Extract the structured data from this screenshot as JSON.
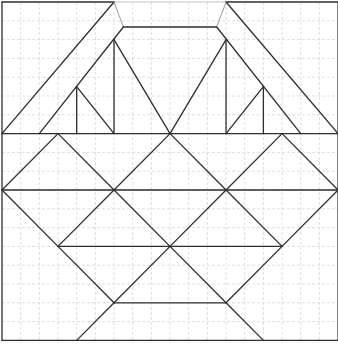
{
  "diagram": {
    "type": "tangram-style geometric figure on dashed grid",
    "grid": {
      "cols": 18,
      "rows": 18,
      "origin_px": [
        2,
        2
      ],
      "cell_px": [
        18.67,
        18.8
      ],
      "color": "#d6d6d6",
      "dashed": true
    },
    "colors": {
      "edge": "#2e2e2e",
      "light_edge": "#9a9a9a",
      "faint_edge": "#c4c4c4"
    },
    "segments": [
      {
        "name": "border-left",
        "from": [
          0,
          0
        ],
        "to": [
          0,
          18
        ],
        "style": "edge"
      },
      {
        "name": "border-right",
        "from": [
          18,
          0
        ],
        "to": [
          18,
          18
        ],
        "style": "edge"
      },
      {
        "name": "border-bottom",
        "from": [
          0,
          18
        ],
        "to": [
          18,
          18
        ],
        "style": "edge"
      },
      {
        "name": "border-top-left",
        "from": [
          0,
          0
        ],
        "to": [
          6,
          0
        ],
        "style": "edge"
      },
      {
        "name": "border-top-middle",
        "from": [
          6,
          0
        ],
        "to": [
          12,
          0
        ],
        "style": "faint"
      },
      {
        "name": "border-top-right",
        "from": [
          12,
          0
        ],
        "to": [
          18,
          0
        ],
        "style": "edge"
      },
      {
        "name": "left-outer-diagonal",
        "from": [
          6,
          0
        ],
        "to": [
          0,
          7
        ],
        "style": "edge"
      },
      {
        "name": "left-connector",
        "from": [
          6,
          0
        ],
        "to": [
          6.5,
          1.33
        ],
        "style": "light"
      },
      {
        "name": "top-inner-horizontal",
        "from": [
          6.5,
          1.33
        ],
        "to": [
          11.5,
          1.33
        ],
        "style": "edge"
      },
      {
        "name": "left-inner-diagonal",
        "from": [
          6.5,
          1.33
        ],
        "to": [
          2,
          7
        ],
        "style": "edge"
      },
      {
        "name": "left-triangle-vertical",
        "from": [
          6,
          2
        ],
        "to": [
          6,
          7
        ],
        "style": "edge"
      },
      {
        "name": "left-triangle-right-side",
        "from": [
          6,
          2
        ],
        "to": [
          9,
          7
        ],
        "style": "edge"
      },
      {
        "name": "left-small-triangle-vertical",
        "from": [
          4,
          4.5
        ],
        "to": [
          4,
          7
        ],
        "style": "edge"
      },
      {
        "name": "left-small-triangle-right-side",
        "from": [
          4,
          4.5
        ],
        "to": [
          6,
          7
        ],
        "style": "edge"
      },
      {
        "name": "right-outer-diagonal",
        "from": [
          12,
          0
        ],
        "to": [
          18,
          7
        ],
        "style": "edge"
      },
      {
        "name": "right-connector",
        "from": [
          12,
          0
        ],
        "to": [
          11.5,
          1.33
        ],
        "style": "light"
      },
      {
        "name": "right-inner-diagonal",
        "from": [
          11.5,
          1.33
        ],
        "to": [
          16,
          7
        ],
        "style": "edge"
      },
      {
        "name": "right-triangle-vertical",
        "from": [
          12,
          2
        ],
        "to": [
          12,
          7
        ],
        "style": "edge"
      },
      {
        "name": "right-triangle-left-side",
        "from": [
          12,
          2
        ],
        "to": [
          9,
          7
        ],
        "style": "edge"
      },
      {
        "name": "right-small-triangle-vertical",
        "from": [
          14,
          4.5
        ],
        "to": [
          14,
          7
        ],
        "style": "edge"
      },
      {
        "name": "right-small-triangle-left-side",
        "from": [
          14,
          4.5
        ],
        "to": [
          12,
          7
        ],
        "style": "edge"
      },
      {
        "name": "horizontal-row-7",
        "from": [
          0,
          7
        ],
        "to": [
          18,
          7
        ],
        "style": "edge"
      },
      {
        "name": "diag-3-7-to-0-10",
        "from": [
          3,
          7
        ],
        "to": [
          0,
          10
        ],
        "style": "edge"
      },
      {
        "name": "diag-3-7-to-6-10",
        "from": [
          3,
          7
        ],
        "to": [
          6,
          10
        ],
        "style": "edge"
      },
      {
        "name": "diag-9-7-to-6-10",
        "from": [
          9,
          7
        ],
        "to": [
          6,
          10
        ],
        "style": "edge"
      },
      {
        "name": "diag-9-7-to-12-10",
        "from": [
          9,
          7
        ],
        "to": [
          12,
          10
        ],
        "style": "edge"
      },
      {
        "name": "diag-15-7-to-12-10",
        "from": [
          15,
          7
        ],
        "to": [
          12,
          10
        ],
        "style": "edge"
      },
      {
        "name": "diag-15-7-to-18-10",
        "from": [
          15,
          7
        ],
        "to": [
          18,
          10
        ],
        "style": "edge"
      },
      {
        "name": "horizontal-row-10",
        "from": [
          0,
          10
        ],
        "to": [
          18,
          10
        ],
        "style": "edge"
      },
      {
        "name": "diag-0-10-to-3-13",
        "from": [
          0,
          10
        ],
        "to": [
          3,
          13
        ],
        "style": "edge"
      },
      {
        "name": "diag-6-10-to-3-13",
        "from": [
          6,
          10
        ],
        "to": [
          3,
          13
        ],
        "style": "edge"
      },
      {
        "name": "diag-6-10-to-9-13",
        "from": [
          6,
          10
        ],
        "to": [
          9,
          13
        ],
        "style": "edge"
      },
      {
        "name": "diag-12-10-to-9-13",
        "from": [
          12,
          10
        ],
        "to": [
          9,
          13
        ],
        "style": "edge"
      },
      {
        "name": "diag-12-10-to-15-13",
        "from": [
          12,
          10
        ],
        "to": [
          15,
          13
        ],
        "style": "edge"
      },
      {
        "name": "diag-18-10-to-15-13",
        "from": [
          18,
          10
        ],
        "to": [
          15,
          13
        ],
        "style": "edge"
      },
      {
        "name": "horizontal-row-13",
        "from": [
          3,
          13
        ],
        "to": [
          15,
          13
        ],
        "style": "edge"
      },
      {
        "name": "diag-3-13-to-6-16",
        "from": [
          3,
          13
        ],
        "to": [
          6,
          16
        ],
        "style": "edge"
      },
      {
        "name": "diag-9-13-to-6-16",
        "from": [
          9,
          13
        ],
        "to": [
          6,
          16
        ],
        "style": "edge"
      },
      {
        "name": "diag-9-13-to-12-16",
        "from": [
          9,
          13
        ],
        "to": [
          12,
          16
        ],
        "style": "edge"
      },
      {
        "name": "diag-15-13-to-12-16",
        "from": [
          15,
          13
        ],
        "to": [
          12,
          16
        ],
        "style": "edge"
      },
      {
        "name": "horizontal-row-16",
        "from": [
          6,
          16
        ],
        "to": [
          12,
          16
        ],
        "style": "edge"
      },
      {
        "name": "diag-6-16-to-4-18",
        "from": [
          6,
          16
        ],
        "to": [
          4,
          18
        ],
        "style": "edge"
      },
      {
        "name": "diag-12-16-to-14-18",
        "from": [
          12,
          16
        ],
        "to": [
          14,
          18
        ],
        "style": "edge"
      }
    ]
  }
}
